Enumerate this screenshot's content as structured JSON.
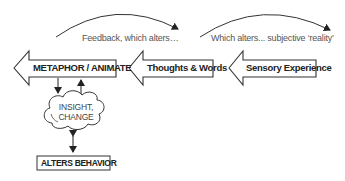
{
  "diagram": {
    "flow_nodes": [
      {
        "id": "metaphor",
        "label": "METAPHOR / ANIMATE",
        "shape": "left-arrow"
      },
      {
        "id": "thoughts",
        "label": "Thoughts & Words",
        "shape": "left-arrow"
      },
      {
        "id": "sensory",
        "label": "Sensory Experience",
        "shape": "left-arrow"
      }
    ],
    "arcs": [
      {
        "label": "Feedback, which alters…",
        "from": "metaphor",
        "to": "thoughts"
      },
      {
        "label": "Which alters... subjective ‘reality’",
        "from": "thoughts",
        "to": "sensory"
      }
    ],
    "cloud": {
      "line1": "INSIGHT,",
      "line2": "CHANGE"
    },
    "behavior": {
      "label": "ALTERS BEHAVIOR"
    },
    "colors": {
      "stroke": "#333333",
      "text": "#222222",
      "caption": "#555555"
    }
  }
}
